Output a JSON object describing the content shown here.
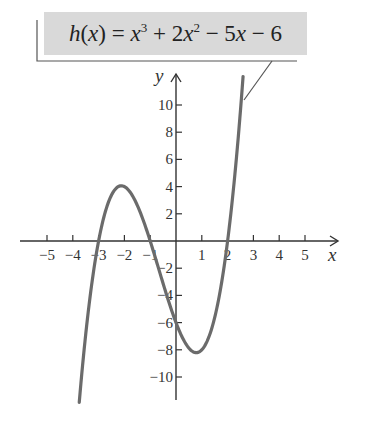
{
  "chart_data": {
    "type": "line",
    "function": {
      "name": "h",
      "expression": "x^3 + 2x^2 - 5x - 6",
      "coefficients": [
        1,
        2,
        -5,
        -6
      ],
      "domain_plotted": [
        -3.75,
        2.6
      ]
    },
    "label": {
      "fname": "h",
      "var": "x",
      "parts": [
        "h",
        "(",
        "x",
        ") = ",
        "x",
        "3",
        " + 2",
        "x",
        "2",
        " − 5",
        "x",
        " − 6"
      ]
    },
    "xlabel": "x",
    "ylabel": "y",
    "x_ticks": [
      -5,
      -4,
      -3,
      -2,
      -1,
      1,
      2,
      3,
      4,
      5
    ],
    "x_tick_labels": [
      "−5",
      "−4",
      "−3",
      "−2",
      "−1",
      "1",
      "2",
      "3",
      "4",
      "5"
    ],
    "y_ticks": [
      -10,
      -8,
      -6,
      -4,
      -2,
      2,
      4,
      6,
      8,
      10
    ],
    "y_tick_labels": [
      "−10",
      "−8",
      "−6",
      "−4",
      "−2",
      "2",
      "4",
      "6",
      "8",
      "10"
    ],
    "xlim": [
      -5.5,
      6.2
    ],
    "ylim": [
      -11.7,
      12.3
    ],
    "grid": false,
    "key_points": {
      "roots": [
        -3,
        -1,
        2
      ],
      "y_intercept": -6,
      "local_max": {
        "x": -2.12,
        "y": 4.06
      },
      "local_min": {
        "x": 0.79,
        "y": -8.21
      }
    },
    "curve_color": "#6b6b6b",
    "axis_color": "#333333",
    "label_bg": "#d9d9d9"
  }
}
